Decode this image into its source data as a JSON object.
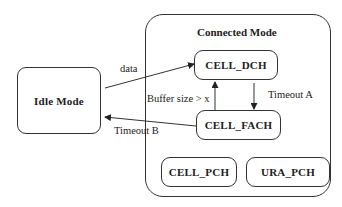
{
  "diagram": {
    "type": "state-diagram",
    "idle_state": {
      "label": "Idle Mode"
    },
    "connected_group": {
      "title": "Connected Mode",
      "states": [
        {
          "id": "cell_dch",
          "label": "CELL_DCH"
        },
        {
          "id": "cell_fach",
          "label": "CELL_FACH"
        },
        {
          "id": "cell_pch",
          "label": "CELL_PCH"
        },
        {
          "id": "ura_pch",
          "label": "URA_PCH"
        }
      ]
    },
    "transitions": [
      {
        "from": "Idle Mode",
        "to": "CELL_DCH",
        "label": "data"
      },
      {
        "from": "CELL_DCH",
        "to": "CELL_FACH",
        "label": "Timeout A"
      },
      {
        "from": "CELL_FACH",
        "to": "CELL_DCH",
        "label": "Buffer size > x"
      },
      {
        "from": "CELL_FACH",
        "to": "Idle Mode",
        "label": "Timeout B"
      }
    ],
    "colors": {
      "stroke": "#333333",
      "background": "#ffffff",
      "text": "#222222"
    }
  }
}
